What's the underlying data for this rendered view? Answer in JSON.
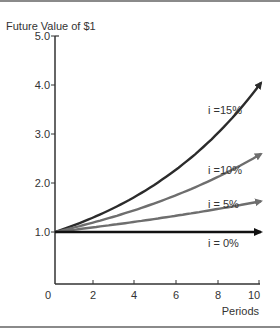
{
  "chart_data": {
    "type": "line",
    "title": "",
    "ylabel": "Future Value of $1",
    "xlabel": "Periods",
    "xlim": [
      0,
      10
    ],
    "ylim": [
      0,
      5.0
    ],
    "x_ticks": [
      "0",
      "2",
      "4",
      "6",
      "8",
      "10"
    ],
    "y_ticks": [
      "1.0",
      "2.0",
      "3.0",
      "4.0",
      "5.0"
    ],
    "grid": false,
    "legend": "inline labels near line ends",
    "x": [
      0,
      1,
      2,
      3,
      4,
      5,
      6,
      7,
      8,
      9,
      10
    ],
    "series": [
      {
        "name": "i =15%",
        "rate": 0.15,
        "color": "#2b2b2b",
        "values": [
          1.0,
          1.15,
          1.32,
          1.52,
          1.75,
          2.01,
          2.31,
          2.66,
          3.06,
          3.52,
          4.05
        ]
      },
      {
        "name": "i =10%",
        "rate": 0.1,
        "color": "#6e6e6e",
        "values": [
          1.0,
          1.1,
          1.21,
          1.33,
          1.46,
          1.61,
          1.77,
          1.95,
          2.14,
          2.36,
          2.59
        ]
      },
      {
        "name": "i = 5%",
        "rate": 0.05,
        "color": "#6e6e6e",
        "values": [
          1.0,
          1.05,
          1.1,
          1.16,
          1.22,
          1.28,
          1.34,
          1.41,
          1.48,
          1.55,
          1.63
        ]
      },
      {
        "name": "i = 0%",
        "rate": 0.0,
        "color": "#111111",
        "values": [
          1.0,
          1.0,
          1.0,
          1.0,
          1.0,
          1.0,
          1.0,
          1.0,
          1.0,
          1.0,
          1.0
        ]
      }
    ]
  },
  "labels": {
    "ylabel": "Future Value of $1",
    "xlabel": "Periods",
    "series_15": "i =15%",
    "series_10": "i =10%",
    "series_5": "i = 5%",
    "series_0": "i = 0%",
    "x0": "0",
    "x2": "2",
    "x4": "4",
    "x6": "6",
    "x8": "8",
    "x10": "10",
    "y1": "1.0",
    "y2": "2.0",
    "y3": "3.0",
    "y4": "4.0",
    "y5": "5.0"
  }
}
